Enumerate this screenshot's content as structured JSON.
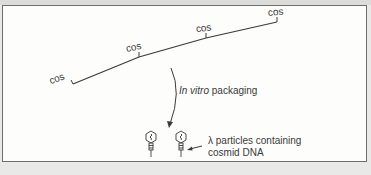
{
  "diagram": {
    "dna": {
      "cos_labels": [
        "cos",
        "cos",
        "cos",
        "cos"
      ]
    },
    "step_label": {
      "italic": "In vitro",
      "rest": " packaging"
    },
    "particle_label": {
      "line1": "λ particles containing",
      "line2": "cosmid DNA"
    },
    "colors": {
      "line": "#3a3a3a",
      "panel": "#fdfdfc",
      "border": "#6e6e6e",
      "background": "#e9e9e7"
    }
  }
}
